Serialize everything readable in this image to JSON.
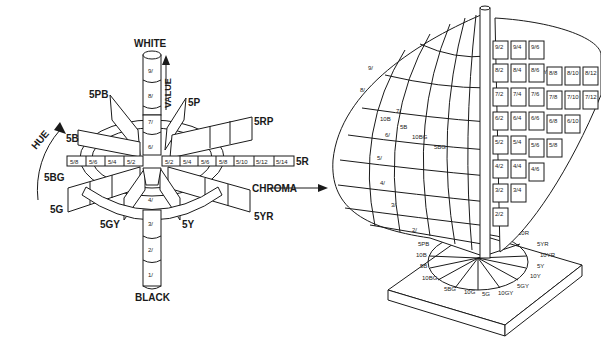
{
  "left_diagram": {
    "top_label": "WHITE",
    "bottom_label": "BLACK",
    "value_axis_label": "VALUE",
    "hue_axis_label": "HUE",
    "chroma_axis_label": "CHROMA",
    "value_steps": [
      "9/",
      "8/",
      "7/",
      "6/",
      "4/",
      "3/",
      "2/",
      "1/"
    ],
    "hue_labels": [
      "5PB",
      "5P",
      "5RP",
      "5B",
      "5R",
      "5BG",
      "5G",
      "5GY",
      "5Y",
      "5YR"
    ],
    "chroma_left": [
      "5/8",
      "5/6",
      "5/4",
      "5/2"
    ],
    "chroma_right": [
      "5/2",
      "5/4",
      "5/6",
      "5/8",
      "5/10",
      "5/12",
      "5/14"
    ]
  },
  "right_diagram": {
    "value_labels": [
      "9/",
      "8/",
      "7/",
      "6/",
      "5/",
      "4/",
      "3/",
      "2/"
    ],
    "hue_labels_left": [
      "10B",
      "5B",
      "10BG",
      "5BG"
    ],
    "page_hue_label": "5Y",
    "chip_rows": [
      [
        "9/2",
        "9/4",
        "9/6"
      ],
      [
        "8/2",
        "8/4",
        "8/6",
        "8/8",
        "8/10",
        "8/12"
      ],
      [
        "7/2",
        "7/4",
        "7/6",
        "7/8",
        "7/10",
        "7/12"
      ],
      [
        "6/2",
        "6/4",
        "6/6",
        "6/8",
        "6/10"
      ],
      [
        "5/2",
        "5/4",
        "5/6",
        "5/8"
      ],
      [
        "4/2",
        "4/4",
        "4/6"
      ],
      [
        "3/2",
        "3/4"
      ],
      [
        "2/2"
      ]
    ],
    "base_hue_ring": [
      "10R",
      "5YR",
      "10YR",
      "5Y",
      "10Y",
      "5GY",
      "10GY",
      "5G",
      "10G",
      "5BG",
      "10BG",
      "5B",
      "10B",
      "5PB"
    ]
  }
}
